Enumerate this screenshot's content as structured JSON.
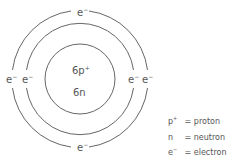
{
  "atom": {
    "nucleus": {
      "protons_label": "6p",
      "protons_charge": "+",
      "neutrons_label": "6n"
    },
    "shells": [
      {
        "name": "inner",
        "electrons": 2
      },
      {
        "name": "outer",
        "electrons": 4
      }
    ],
    "electron_symbol": "e",
    "electron_charge": "−"
  },
  "legend": [
    {
      "symbol": "p",
      "charge": "+",
      "eq": "=",
      "meaning": "proton"
    },
    {
      "symbol": "n",
      "charge": "",
      "eq": "=",
      "meaning": "neutron"
    },
    {
      "symbol": "e",
      "charge": "−",
      "eq": "=",
      "meaning": "electron"
    }
  ],
  "colors": {
    "stroke": "#666666",
    "text": "#555555"
  }
}
